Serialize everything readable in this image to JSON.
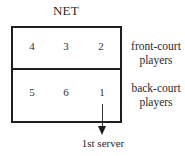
{
  "diagram": {
    "net_label": "NET",
    "court": {
      "front_row": {
        "positions": [
          "4",
          "3",
          "2"
        ],
        "label_line1": "front-court",
        "label_line2": "players"
      },
      "back_row": {
        "positions": [
          "5",
          "6",
          "1"
        ],
        "label_line1": "back-court",
        "label_line2": "players"
      }
    },
    "server_arrow": {
      "from_position": "1",
      "label": "1st server"
    },
    "colors": {
      "line": "#1f1f1f",
      "text": "#2a2a2a",
      "background": "#ffffff"
    }
  }
}
